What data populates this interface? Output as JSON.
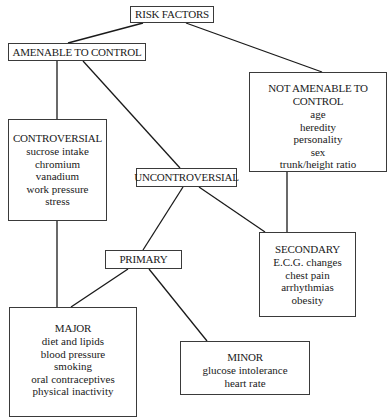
{
  "diagram": {
    "type": "tree",
    "nodes": {
      "risk_factors": {
        "title": "RISK FACTORS"
      },
      "amenable": {
        "title": "AMENABLE TO CONTROL"
      },
      "not_amenable": {
        "title_line1": "NOT AMENABLE TO",
        "title_line2": "CONTROL",
        "items": [
          "age",
          "heredity",
          "personality",
          "sex",
          "trunk/height ratio"
        ]
      },
      "controversial": {
        "title": "CONTROVERSIAL",
        "items": [
          "sucrose intake",
          "chromium",
          "vanadium",
          "work pressure",
          "stress"
        ]
      },
      "uncontroversial": {
        "title": "UNCONTROVERSIAL"
      },
      "primary": {
        "title": "PRIMARY"
      },
      "secondary": {
        "title": "SECONDARY",
        "items": [
          "E.C.G. changes",
          "chest pain",
          "arrhythmias",
          "obesity"
        ]
      },
      "major": {
        "title": "MAJOR",
        "items": [
          "diet and lipids",
          "blood pressure",
          "smoking",
          "oral contraceptives",
          "physical inactivity"
        ]
      },
      "minor": {
        "title": "MINOR",
        "items": [
          "glucose intolerance",
          "heart rate"
        ]
      }
    },
    "edges": [
      [
        "risk_factors",
        "amenable"
      ],
      [
        "risk_factors",
        "not_amenable"
      ],
      [
        "amenable",
        "controversial"
      ],
      [
        "amenable",
        "uncontroversial"
      ],
      [
        "not_amenable",
        "secondary"
      ],
      [
        "uncontroversial",
        "primary"
      ],
      [
        "uncontroversial",
        "secondary"
      ],
      [
        "controversial",
        "major"
      ],
      [
        "primary",
        "major"
      ],
      [
        "primary",
        "minor"
      ]
    ]
  }
}
